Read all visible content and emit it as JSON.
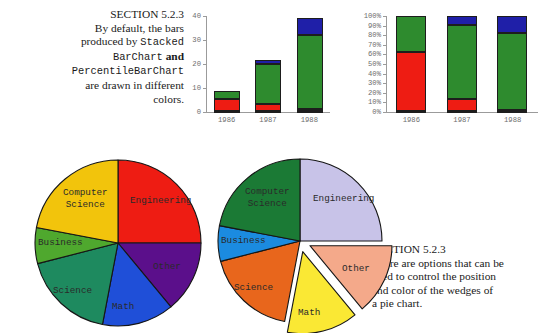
{
  "page": {
    "width": 556,
    "height": 335,
    "background": "#ffffff"
  },
  "caption_top": {
    "heading": "SECTION 5.2.3",
    "line1": "By default, the bars",
    "line2_prefix": "produced by ",
    "line2_code": "Stacked",
    "line3_code": "BarChart",
    "line3_suffix": " and",
    "line4_code": "PercentileBarChart",
    "line5": "are drawn in different",
    "line6": "colors."
  },
  "caption_bottom": {
    "heading": "SECTION 5.2.3",
    "line1": "There are options that can be",
    "line2": "used to control the position",
    "line3": "and color of the wedges of",
    "line4": "a pie chart."
  },
  "chart_data": [
    {
      "id": "stacked-bar-chart",
      "type": "bar",
      "stacked": true,
      "title": "",
      "xlabel": "",
      "ylabel": "",
      "categories": [
        "1986",
        "1987",
        "1988"
      ],
      "ytick_labels": [
        "0",
        "10",
        "20",
        "30",
        "40"
      ],
      "ytick_values": [
        0,
        10,
        20,
        30,
        40
      ],
      "ylim": [
        0,
        40
      ],
      "grid": false,
      "legend": "none",
      "series": [
        {
          "name": "series-1",
          "color": "#8B2B00",
          "values": [
            0.4,
            0.5,
            0.6
          ]
        },
        {
          "name": "series-2",
          "color": "#EE1C13",
          "values": [
            5.0,
            3.0,
            0.5
          ]
        },
        {
          "name": "series-3",
          "color": "#2E8B2E",
          "values": [
            3.2,
            16.5,
            31.0
          ]
        },
        {
          "name": "series-4",
          "color": "#1F1FA8",
          "values": [
            0.0,
            1.8,
            7.0
          ]
        }
      ],
      "totals": [
        8.6,
        21.8,
        39.1
      ]
    },
    {
      "id": "percentile-bar-chart",
      "type": "bar",
      "stacked": true,
      "percentile": true,
      "title": "",
      "xlabel": "",
      "ylabel": "",
      "categories": [
        "1986",
        "1987",
        "1988"
      ],
      "ytick_labels": [
        "0%",
        "10%",
        "20%",
        "30%",
        "40%",
        "50%",
        "60%",
        "70%",
        "80%",
        "90%",
        "100%"
      ],
      "ytick_values": [
        0,
        10,
        20,
        30,
        40,
        50,
        60,
        70,
        80,
        90,
        100
      ],
      "ylim": [
        0,
        100
      ],
      "grid": false,
      "legend": "none",
      "series": [
        {
          "name": "series-1",
          "color": "#8B2B00",
          "values": [
            1.0,
            1.5,
            1.5
          ]
        },
        {
          "name": "series-2",
          "color": "#EE1C13",
          "values": [
            61.0,
            12.0,
            0.5
          ]
        },
        {
          "name": "series-3",
          "color": "#2E8B2E",
          "values": [
            38.0,
            77.5,
            80.0
          ]
        },
        {
          "name": "series-4",
          "color": "#1F1FA8",
          "values": [
            0.0,
            9.0,
            18.0
          ]
        }
      ]
    },
    {
      "id": "pie-chart-default",
      "type": "pie",
      "title": "",
      "exploded": false,
      "start_angle_deg": 90,
      "direction": "clockwise",
      "slices": [
        {
          "label": "Engineering",
          "value": 25.0,
          "color": "#EE1C13",
          "exploded": false
        },
        {
          "label": "Other",
          "value": 14.0,
          "color": "#5B0F8B",
          "exploded": false
        },
        {
          "label": "Math",
          "value": 14.0,
          "color": "#1F4FD8",
          "exploded": false
        },
        {
          "label": "Science",
          "value": 18.0,
          "color": "#1E8A5F",
          "exploded": false
        },
        {
          "label": "Business",
          "value": 7.0,
          "color": "#4FA82E",
          "exploded": false
        },
        {
          "label": "Computer Science",
          "value": 22.0,
          "color": "#F2C40C",
          "exploded": false
        }
      ]
    },
    {
      "id": "pie-chart-exploded",
      "type": "pie",
      "title": "",
      "exploded": true,
      "start_angle_deg": 90,
      "direction": "clockwise",
      "slices": [
        {
          "label": "Engineering",
          "value": 25.0,
          "color": "#C8C3E8",
          "exploded": false
        },
        {
          "label": "Other",
          "value": 14.0,
          "color": "#F4A98A",
          "exploded": true
        },
        {
          "label": "Math",
          "value": 14.0,
          "color": "#FAE834",
          "exploded": true
        },
        {
          "label": "Science",
          "value": 18.0,
          "color": "#E8661C",
          "exploded": false
        },
        {
          "label": "Business",
          "value": 7.0,
          "color": "#1B8BE0",
          "exploded": false
        },
        {
          "label": "Computer Science",
          "value": 22.0,
          "color": "#1B7A35",
          "exploded": false
        }
      ]
    }
  ]
}
